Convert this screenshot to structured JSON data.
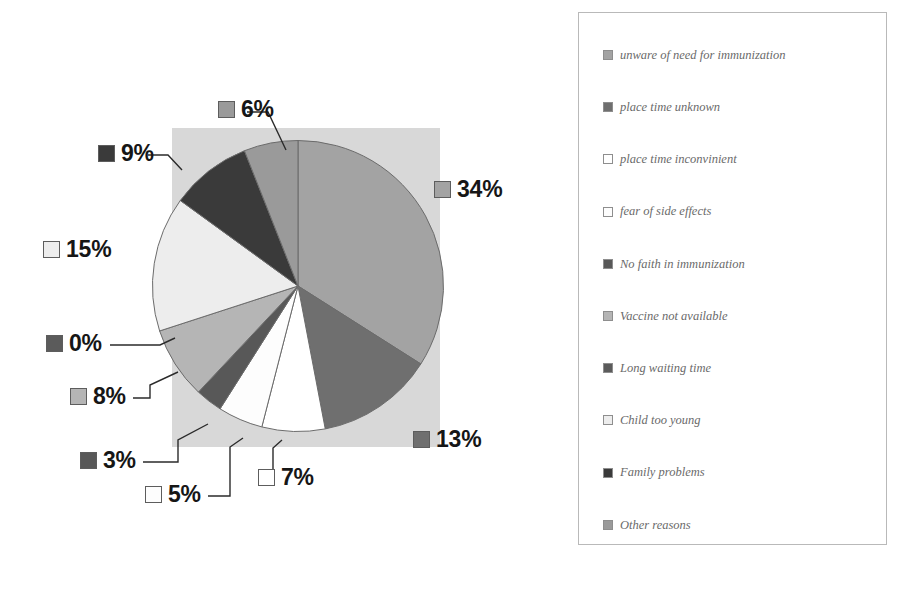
{
  "chart_data": {
    "type": "pie",
    "title": "",
    "xlabel": "",
    "ylabel": "",
    "legend_position": "right",
    "grid": false,
    "plot_background": "#d8d8d8",
    "start_angle_deg": 0,
    "direction": "clockwise",
    "categories": [
      "unware of need for immunization",
      "place time unknown",
      "place  time inconvinient",
      "fear of side effects",
      "No faith in immunization",
      "Vaccine not available",
      "Long waiting time",
      "Child too young",
      "Family problems",
      "Other reasons"
    ],
    "values": [
      34,
      13,
      7,
      5,
      3,
      8,
      0,
      15,
      9,
      6
    ],
    "labels": [
      "34%",
      "13%",
      "7%",
      "5%",
      "3%",
      "8%",
      "0%",
      "15%",
      "9%",
      "6%"
    ],
    "colors": [
      "#a3a3a3",
      "#6f6f6f",
      "#ffffff",
      "#fdfdfd",
      "#585858",
      "#b5b5b5",
      "#5b5b5b",
      "#ededed",
      "#3a3a3a",
      "#9a9a9a"
    ],
    "slice_border": "#6b6b6b"
  },
  "pie_labels": [
    {
      "text": "6%",
      "color": "#9a9a9a"
    },
    {
      "text": "9%",
      "color": "#3a3a3a"
    },
    {
      "text": "15%",
      "color": "#ededed"
    },
    {
      "text": "0%",
      "color": "#5b5b5b"
    },
    {
      "text": "8%",
      "color": "#b5b5b5"
    },
    {
      "text": "3%",
      "color": "#585858"
    },
    {
      "text": "5%",
      "color": "#fdfdfd"
    },
    {
      "text": "7%",
      "color": "#ffffff"
    },
    {
      "text": "13%",
      "color": "#6f6f6f"
    },
    {
      "text": "34%",
      "color": "#a3a3a3"
    }
  ],
  "legend": {
    "items": [
      {
        "label": "unware of need for immunization",
        "color": "#a3a3a3"
      },
      {
        "label": "place time unknown",
        "color": "#6f6f6f"
      },
      {
        "label": "place  time inconvinient",
        "color": "#ffffff"
      },
      {
        "label": "fear of side effects",
        "color": "#fdfdfd"
      },
      {
        "label": "No faith in immunization",
        "color": "#585858"
      },
      {
        "label": "Vaccine not available",
        "color": "#b5b5b5"
      },
      {
        "label": "Long waiting time",
        "color": "#5b5b5b"
      },
      {
        "label": "Child too young",
        "color": "#ededed"
      },
      {
        "label": "Family problems",
        "color": "#3a3a3a"
      },
      {
        "label": "Other reasons",
        "color": "#9a9a9a"
      }
    ]
  }
}
